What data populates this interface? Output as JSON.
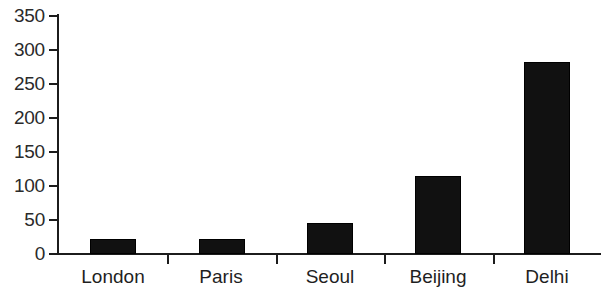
{
  "chart_data": {
    "type": "bar",
    "title": "",
    "subtitle": "",
    "xlabel": "",
    "ylabel": "",
    "categories": [
      "London",
      "Paris",
      "Seoul",
      "Beijing",
      "Delhi"
    ],
    "values": [
      22,
      22,
      45,
      115,
      282
    ],
    "series": [
      {
        "name": "",
        "values": [
          22,
          22,
          45,
          115,
          282
        ]
      }
    ],
    "ylim": [
      0,
      350
    ],
    "ytick_labels": [
      "0",
      "50",
      "100",
      "150",
      "200",
      "250",
      "300",
      "350"
    ],
    "ytick_values": [
      0,
      50,
      100,
      150,
      200,
      250,
      300,
      350
    ],
    "grid": false,
    "legend": false,
    "legend_position": "none",
    "bar_color": "#111111",
    "axis_color": "#1c1c1c",
    "background_color": "#ffffff",
    "annotations": []
  }
}
